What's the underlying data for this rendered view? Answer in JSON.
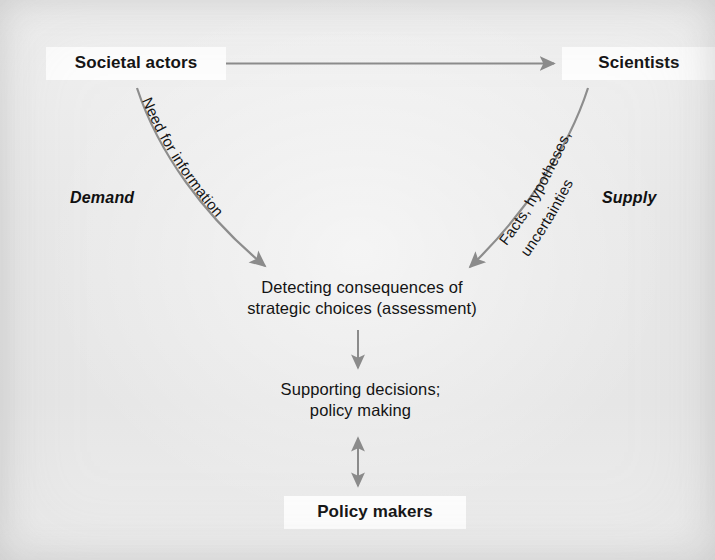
{
  "diagram": {
    "background_color": "#ececec",
    "label_background_color": "#fdfdfd",
    "arrow_color": "#8b8b8b",
    "text_color": "#141414"
  },
  "nodes": {
    "societal_actors": "Societal actors",
    "scientists": "Scientists",
    "assessment": "Detecting consequences of\nstrategic choices (assessment)",
    "supporting_decisions": "Supporting decisions;\npolicy making",
    "policy_makers": "Policy makers"
  },
  "side_labels": {
    "demand": "Demand",
    "supply": "Supply"
  },
  "edge_labels": {
    "need_for_information": "Need for information",
    "facts_line1": "Facts, hypotheses,",
    "facts_line2": "uncertainties"
  },
  "edges": [
    {
      "name": "societal-actors-scientists",
      "from": "Societal actors",
      "to": "Scientists",
      "direction": "bidirectional",
      "style": "straight-horizontal",
      "label": ""
    },
    {
      "name": "societal-actors-assessment",
      "from": "Societal actors",
      "to": "Detecting consequences of strategic choices (assessment)",
      "direction": "one-way",
      "style": "curved",
      "label": "Need for information"
    },
    {
      "name": "scientists-assessment",
      "from": "Scientists",
      "to": "Detecting consequences of strategic choices (assessment)",
      "direction": "one-way",
      "style": "curved",
      "label": "Facts, hypotheses, uncertainties"
    },
    {
      "name": "assessment-supporting-decisions",
      "from": "Detecting consequences of strategic choices (assessment)",
      "to": "Supporting decisions; policy making",
      "direction": "one-way",
      "style": "straight-vertical",
      "label": ""
    },
    {
      "name": "supporting-decisions-policy-makers",
      "from": "Supporting decisions; policy making",
      "to": "Policy makers",
      "direction": "bidirectional",
      "style": "straight-vertical",
      "label": ""
    }
  ]
}
